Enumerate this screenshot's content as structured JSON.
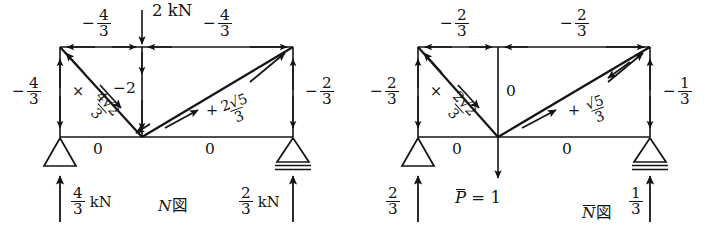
{
  "figure": {
    "panels": [
      {
        "id": "left",
        "caption": "N図",
        "caption_italic_part": "N",
        "caption_suffix": "図",
        "load": {
          "label": "2 kN",
          "direction": "down",
          "at": "top-center"
        },
        "members": [
          {
            "name": "top-chord-left",
            "value": "−4/3",
            "sign": "−",
            "num": "4",
            "den": "3"
          },
          {
            "name": "top-chord-right",
            "value": "−4/3",
            "sign": "−",
            "num": "4",
            "den": "3"
          },
          {
            "name": "left-vertical",
            "value": "−4/3",
            "sign": "−",
            "num": "4",
            "den": "3"
          },
          {
            "name": "right-vertical",
            "value": "−2/3",
            "sign": "−",
            "num": "2",
            "den": "3"
          },
          {
            "name": "center-vertical",
            "value": "−2",
            "sign": "−",
            "num": "2",
            "den": ""
          },
          {
            "name": "left-diagonal",
            "value": "× 4√2/3",
            "sign": "×",
            "num": "4√2",
            "den": "3"
          },
          {
            "name": "right-diagonal",
            "value": "+ 2√5/3",
            "sign": "+",
            "num": "2√5",
            "den": "3"
          },
          {
            "name": "bottom-chord-left",
            "value": "0"
          },
          {
            "name": "bottom-chord-right",
            "value": "0"
          }
        ],
        "reactions": [
          {
            "name": "left-reaction",
            "num": "4",
            "den": "3",
            "unit": "kN",
            "direction": "up"
          },
          {
            "name": "right-reaction",
            "num": "2",
            "den": "3",
            "unit": "kN",
            "direction": "up"
          }
        ],
        "supports": [
          {
            "name": "pin-support",
            "type": "pin",
            "at": "bottom-left"
          },
          {
            "name": "roller-support",
            "type": "roller",
            "at": "bottom-right"
          }
        ]
      },
      {
        "id": "right",
        "caption": "N̄図",
        "caption_italic_part": "N",
        "caption_suffix": "図",
        "load": {
          "label": "P̄ = 1",
          "label_italic": "P",
          "label_rest": " = 1",
          "direction": "down",
          "at": "bottom-center"
        },
        "members": [
          {
            "name": "top-chord-left",
            "value": "−2/3",
            "sign": "−",
            "num": "2",
            "den": "3"
          },
          {
            "name": "top-chord-right",
            "value": "−2/3",
            "sign": "−",
            "num": "2",
            "den": "3"
          },
          {
            "name": "left-vertical",
            "value": "−2/3",
            "sign": "−",
            "num": "2",
            "den": "3"
          },
          {
            "name": "right-vertical",
            "value": "−1/3",
            "sign": "−",
            "num": "1",
            "den": "3"
          },
          {
            "name": "center-vertical",
            "value": "0"
          },
          {
            "name": "left-diagonal",
            "value": "× 2√2/3",
            "sign": "×",
            "num": "2√2",
            "den": "3"
          },
          {
            "name": "right-diagonal",
            "value": "+ √5/3",
            "sign": "+",
            "num": "√5",
            "den": "3"
          },
          {
            "name": "bottom-chord-left",
            "value": "0"
          },
          {
            "name": "bottom-chord-right",
            "value": "0"
          }
        ],
        "reactions": [
          {
            "name": "left-reaction",
            "num": "2",
            "den": "3",
            "unit": "",
            "direction": "up"
          },
          {
            "name": "right-reaction",
            "num": "1",
            "den": "3",
            "unit": "",
            "direction": "up"
          }
        ],
        "supports": [
          {
            "name": "pin-support",
            "type": "pin",
            "at": "bottom-left"
          },
          {
            "name": "roller-support",
            "type": "roller",
            "at": "bottom-right"
          }
        ]
      }
    ],
    "colors": {
      "ink": "#141414",
      "background": "#ffffff"
    }
  },
  "text": {
    "zero": "0",
    "minus": "−",
    "plus": "+",
    "times": "×",
    "kN": "kN",
    "two_kN": "2 kN",
    "minus_two": "−2",
    "sqrt": "√",
    "fig_char": "図",
    "N": "N",
    "P": "P",
    "eq1": "= 1",
    "four": "4",
    "three": "3",
    "two": "2",
    "one": "1",
    "r2": "2",
    "r5": "5",
    "n4s2": "4√2",
    "n2s2": "2√2",
    "n2s5": "2√5",
    "ns5": "√5"
  }
}
